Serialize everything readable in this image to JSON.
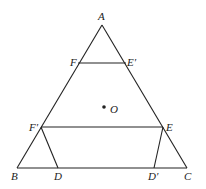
{
  "diagram": {
    "type": "geometry",
    "points": {
      "A": "A",
      "B": "B",
      "C": "C",
      "D": "D",
      "D_prime": "D′",
      "E": "E",
      "E_prime": "E′",
      "F": "F",
      "F_prime": "F′",
      "O": "O"
    },
    "segments": [
      [
        "A",
        "B"
      ],
      [
        "A",
        "C"
      ],
      [
        "B",
        "C"
      ],
      [
        "F",
        "E′"
      ],
      [
        "F′",
        "E"
      ],
      [
        "F′",
        "D"
      ],
      [
        "E",
        "D′"
      ]
    ]
  }
}
